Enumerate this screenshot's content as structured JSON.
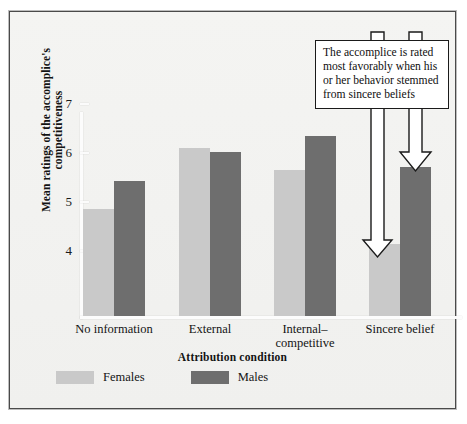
{
  "figure": {
    "callout": "The accomplice is rated most favorably when his or her behavior stemmed from sincere beliefs",
    "legend": [
      {
        "label": "Females",
        "color": "#c9c9c9",
        "swatch_name": "legend-swatch-females"
      },
      {
        "label": "Males",
        "color": "#6e6e6e",
        "swatch_name": "legend-swatch-males"
      }
    ]
  },
  "chart_data": {
    "type": "bar",
    "title": "",
    "xlabel": "Attribution condition",
    "ylabel": "Mean ratings of the accomplice's competitiveness",
    "categories": [
      "No information",
      "External",
      "Internal–\ncompetitive",
      "Sincere belief"
    ],
    "categories_flat": [
      "No information",
      "External",
      "Internal–competitive",
      "Sincere belief"
    ],
    "series": [
      {
        "name": "Females",
        "color": "#c9c9c9",
        "values": [
          4.85,
          6.1,
          5.65,
          4.15
        ]
      },
      {
        "name": "Males",
        "color": "#6e6e6e",
        "values": [
          5.42,
          6.02,
          6.35,
          5.72
        ]
      }
    ],
    "ylim": [
      3.35,
      7.1
    ],
    "yticks": [
      7,
      6,
      5,
      4
    ],
    "ytick_labels": [
      "7",
      "6",
      "5",
      "4"
    ],
    "grid": false,
    "legend_position": "bottom-left",
    "annotations": [
      {
        "text": "The accomplice is rated most favorably when his or her behavior stemmed from sincere beliefs",
        "points_to": [
          "Sincere belief / Females",
          "Sincere belief / Males"
        ]
      }
    ]
  }
}
